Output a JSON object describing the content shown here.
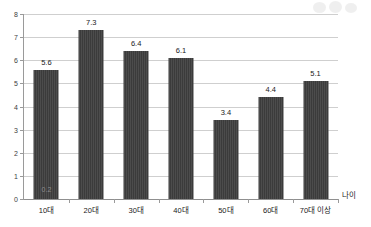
{
  "chart_data": {
    "type": "bar",
    "title": "",
    "subtitle": "",
    "xlabel": "나이",
    "ylabel": "",
    "categories": [
      "10대",
      "20대",
      "30대",
      "40대",
      "50대",
      "60대",
      "70대 이상"
    ],
    "values": [
      5.6,
      7.3,
      6.4,
      6.1,
      3.4,
      4.4,
      5.1
    ],
    "value_labels": [
      "5.6",
      "7.3",
      "6.4",
      "6.1",
      "3.4",
      "4.4",
      "5.1"
    ],
    "ylim": [
      0,
      8
    ],
    "ytick_values": [
      0,
      1,
      2,
      3,
      4,
      5,
      6,
      7,
      8
    ],
    "ytick_labels": [
      "0",
      "1",
      "2",
      "3",
      "4",
      "5",
      "6",
      "7",
      "8"
    ],
    "grid": true,
    "legend": false,
    "legend_position": "none",
    "annotations": [
      {
        "text": "0.2",
        "category": "10대",
        "value": 0.2,
        "placement": "inside-bar-bottom"
      }
    ],
    "bar_color": "#3b3b3b",
    "gridline_color": "#cfcfcf",
    "axis_color": "#9a9a9a",
    "background_color": "#ffffff"
  },
  "figure": {
    "watermark_present": true
  }
}
